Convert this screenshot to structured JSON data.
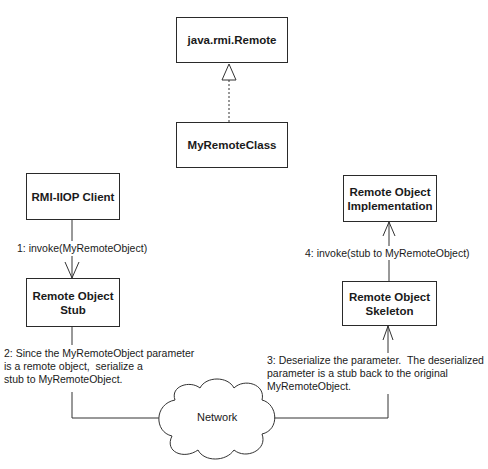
{
  "diagram": {
    "boxes": {
      "remote_interface": {
        "label": "java.rmi.Remote"
      },
      "my_remote_class": {
        "label": "MyRemoteClass"
      },
      "client": {
        "label": "RMI-IIOP Client"
      },
      "stub": {
        "label": "Remote Object\nStub"
      },
      "implementation": {
        "label": "Remote Object\nImplementation"
      },
      "skeleton": {
        "label": "Remote Object\nSkeleton"
      }
    },
    "cloud": {
      "label": "Network"
    },
    "messages": {
      "step1": "1: invoke(MyRemoteObject)",
      "step2": "2: Since the MyRemoteObject parameter\nis a remote object,  serialize a\nstub to MyRemoteObject.",
      "step3": "3: Deserialize the parameter.  The deserialized\nparameter is a stub back to the original\nMyRemoteObject.",
      "step4": "4: invoke(stub to MyRemoteObject)"
    },
    "relationships": [
      {
        "from": "MyRemoteClass",
        "to": "java.rmi.Remote",
        "type": "realization"
      },
      {
        "from": "RMI-IIOP Client",
        "to": "Remote Object Stub",
        "type": "invoke"
      },
      {
        "from": "Remote Object Stub",
        "to": "Network",
        "type": "connection"
      },
      {
        "from": "Network",
        "to": "Remote Object Skeleton",
        "type": "connection"
      },
      {
        "from": "Remote Object Skeleton",
        "to": "Remote Object Implementation",
        "type": "invoke"
      }
    ]
  }
}
